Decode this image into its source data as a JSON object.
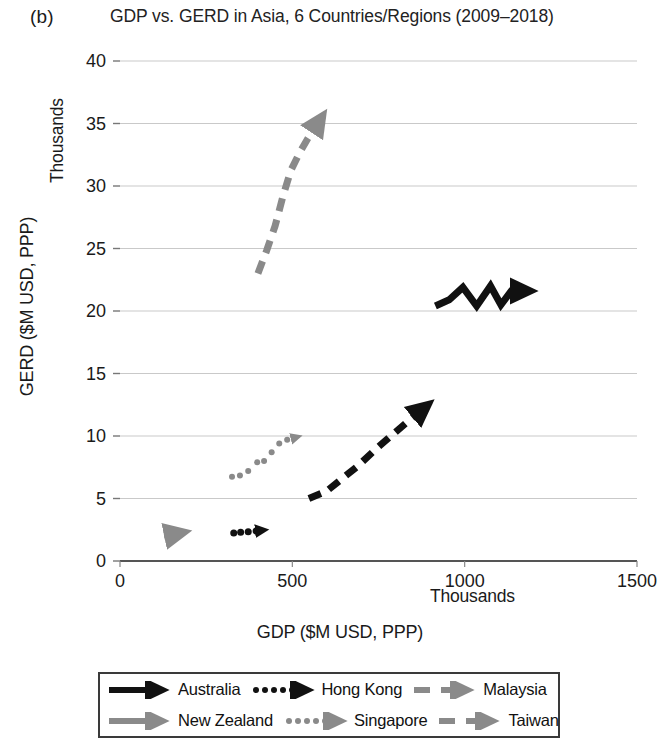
{
  "panel": {
    "label": "(b)"
  },
  "chart_data": {
    "type": "scatter",
    "title": "GDP vs. GERD in Asia, 6 Countries/Regions (2009–2018)",
    "xlabel": "GDP ($M USD, PPP)",
    "ylabel": "GERD ($M USD, PPP)",
    "x_units_label": "Thousands",
    "y_units_label": "Thousands",
    "xlim": [
      0,
      1500
    ],
    "ylim": [
      0,
      40
    ],
    "xticks": [
      "0",
      "500",
      "1000",
      "1500"
    ],
    "xtick_values": [
      0,
      500,
      1000,
      1500
    ],
    "yticks": [
      "0",
      "5",
      "10",
      "15",
      "20",
      "25",
      "30",
      "35",
      "40"
    ],
    "ytick_values": [
      0,
      5,
      10,
      15,
      20,
      25,
      30,
      35,
      40
    ],
    "grid": "horizontal",
    "legend_position": "bottom",
    "series": [
      {
        "name": "Australia",
        "style": "solid",
        "color": "#111111",
        "width": 7,
        "arrow": true,
        "points": [
          [
            915,
            20.4
          ],
          [
            955,
            20.9
          ],
          [
            995,
            21.9
          ],
          [
            1035,
            20.4
          ],
          [
            1075,
            22.0
          ],
          [
            1105,
            20.5
          ],
          [
            1135,
            21.6
          ],
          [
            1172,
            21.6
          ]
        ]
      },
      {
        "name": "Hong Kong",
        "style": "dotted",
        "color": "#111111",
        "width": 7,
        "arrow": true,
        "points": [
          [
            330,
            2.25
          ],
          [
            350,
            2.3
          ],
          [
            372,
            2.35
          ],
          [
            395,
            2.4
          ],
          [
            412,
            2.45
          ]
        ]
      },
      {
        "name": "Malaysia",
        "style": "dashed",
        "color": "#111111",
        "width": 7,
        "arrow": true,
        "points": [
          [
            548,
            5.0
          ],
          [
            600,
            5.6
          ],
          [
            645,
            6.6
          ],
          [
            690,
            7.6
          ],
          [
            740,
            8.9
          ],
          [
            790,
            10.1
          ],
          [
            845,
            11.4
          ],
          [
            880,
            12.2
          ]
        ]
      },
      {
        "name": "New Zealand",
        "style": "solid",
        "color": "#8a8a8a",
        "width": 7,
        "arrow": true,
        "points": [
          [
            128,
            2.0
          ],
          [
            150,
            2.1
          ],
          [
            168,
            2.2
          ]
        ]
      },
      {
        "name": "Singapore",
        "style": "dotted",
        "color": "#8a8a8a",
        "width": 6,
        "arrow": true,
        "points": [
          [
            325,
            6.75
          ],
          [
            348,
            6.85
          ],
          [
            372,
            7.2
          ],
          [
            398,
            7.9
          ],
          [
            418,
            8.0
          ],
          [
            440,
            8.7
          ],
          [
            462,
            9.4
          ],
          [
            485,
            9.7
          ],
          [
            512,
            9.9
          ]
        ]
      },
      {
        "name": "Taiwan",
        "style": "dashed",
        "color": "#8a8a8a",
        "width": 7,
        "arrow": true,
        "points": [
          [
            400,
            23.0
          ],
          [
            425,
            24.8
          ],
          [
            450,
            26.8
          ],
          [
            472,
            29.1
          ],
          [
            495,
            31.2
          ],
          [
            520,
            32.6
          ],
          [
            545,
            33.8
          ],
          [
            578,
            35.2
          ]
        ]
      }
    ]
  },
  "legend": {
    "rows": [
      [
        {
          "name": "Australia",
          "key": "solid-dark-arrow"
        },
        {
          "name": "Hong Kong",
          "key": "dotted-dark-arrow"
        },
        {
          "name": "Malaysia",
          "key": "dashed-gray-arrow"
        }
      ],
      [
        {
          "name": "New Zealand",
          "key": "solid-gray-arrow"
        },
        {
          "name": "Singapore",
          "key": "dotted-gray-arrow"
        },
        {
          "name": "Taiwan",
          "key": "dashed-gray-arrow"
        }
      ]
    ]
  }
}
